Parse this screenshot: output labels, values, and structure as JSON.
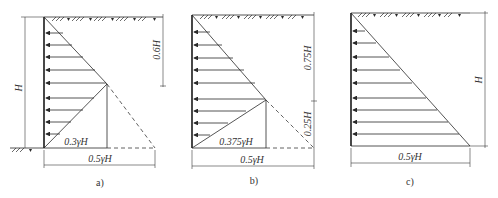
{
  "panels": [
    {
      "id": "a",
      "caption": "a)",
      "labels": {
        "height": "H",
        "upper_depth": "0.6H",
        "inner_width": "0.3γH",
        "outer_width": "0.5γH"
      }
    },
    {
      "id": "b",
      "caption": "b)",
      "labels": {
        "upper_depth": "0.75H",
        "lower_depth": "0.25H",
        "inner_width": "0.375γH",
        "outer_width": "0.5γH"
      }
    },
    {
      "id": "c",
      "caption": "c)",
      "labels": {
        "height": "H",
        "outer_width": "0.5γH"
      }
    }
  ],
  "colors": {
    "line": "#2a2a2a",
    "background": "#ffffff"
  }
}
